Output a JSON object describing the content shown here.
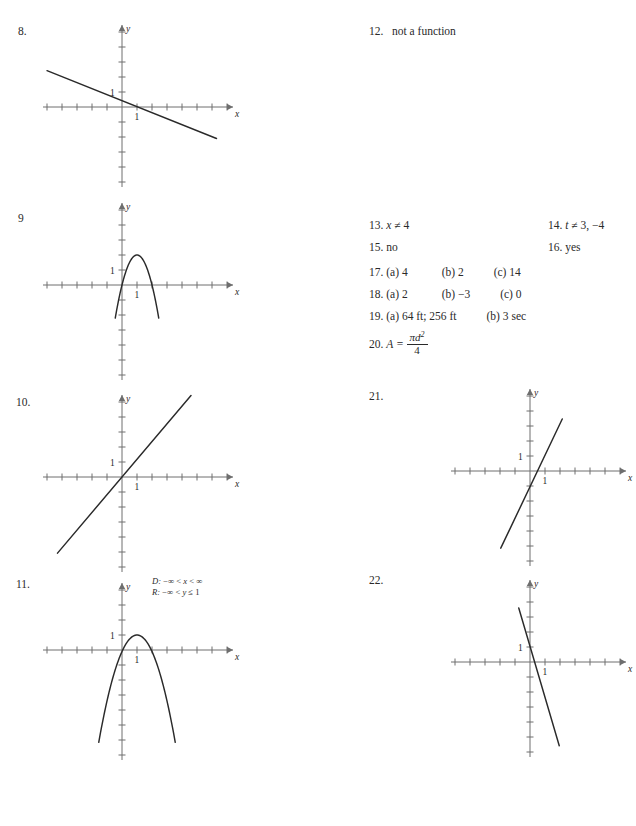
{
  "page": {
    "width": 636,
    "height": 826,
    "background": "#ffffff",
    "ink": "#2a2a2a",
    "axis_color": "#6e6e6e"
  },
  "left_column": {
    "items": [
      {
        "number": "8.",
        "num_x": 18,
        "num_y": 25,
        "graph": {
          "x": 40,
          "y": 14,
          "w": 190,
          "h": 170,
          "origin_x": 82,
          "origin_y": 93,
          "unit": 15,
          "x_ticks_left": 5,
          "x_ticks_right": 7,
          "y_ticks_up": 5,
          "y_ticks_down": 5,
          "x_label": "x",
          "y_label": "y",
          "one_x_label": "1",
          "one_y_label": "1",
          "type": "line",
          "slope": -0.4,
          "intercept": 0.42,
          "x_from": -5.0,
          "x_to": 6.3
        }
      },
      {
        "number": "9",
        "num_x": 18,
        "num_y": 212,
        "graph": {
          "x": 40,
          "y": 200,
          "w": 190,
          "h": 1.0,
          "origin_x": 82,
          "origin_y": 85,
          "unit": 15,
          "x_ticks_left": 5,
          "x_ticks_right": 7,
          "y_ticks_up": 5,
          "y_ticks_down": 6,
          "x_label": "x",
          "y_label": "y",
          "one_x_label": "1",
          "one_y_label": "1",
          "type": "parabola",
          "a": -2.0,
          "k": 2.0,
          "x_from": -0.45,
          "x_to": 2.45
        }
      },
      {
        "number": "10.",
        "num_x": 16,
        "num_y": 396,
        "graph": {
          "x": 40,
          "y": 386,
          "w": 190,
          "h": 180,
          "origin_x": 82,
          "origin_y": 91,
          "unit": 15,
          "x_ticks_left": 5,
          "x_ticks_right": 7,
          "y_ticks_up": 5,
          "y_ticks_down": 6,
          "x_label": "x",
          "y_label": "y",
          "one_x_label": "1",
          "one_y_label": "1",
          "type": "line",
          "slope": 1.18,
          "intercept": 0,
          "x_from": -4.3,
          "x_to": 4.6
        }
      },
      {
        "number": "11.",
        "num_x": 16,
        "num_y": 578,
        "graph": {
          "x": 40,
          "y": 582,
          "w": 190,
          "h": 1.0,
          "origin_x": 82,
          "origin_y": 68,
          "unit": 15,
          "x_ticks_left": 5,
          "x_ticks_right": 7,
          "y_ticks_up": 4,
          "y_ticks_down": 7,
          "x_label": "x",
          "y_label": "y",
          "one_x_label": "1",
          "one_y_label": "1",
          "type": "parabola",
          "a": -1.1,
          "k": 1.0,
          "x_from": -1.55,
          "x_to": 3.55
        },
        "annotation": {
          "x": 152,
          "y": 576,
          "line1_prefix": "D:",
          "line1_body": " −∞ < x < ∞",
          "line2_prefix": "R:",
          "line2_body": " −∞ < y ≤ 1"
        }
      }
    ]
  },
  "right_column": {
    "item12": {
      "number": "12.",
      "num_x": 369,
      "num_y": 25,
      "text": "not a function",
      "text_x": 392,
      "text_y": 25,
      "graph": {
        "x": 455,
        "y": 20,
        "w": 175,
        "h": -1.0,
        "origin_x": 52,
        "origin_y": 91,
        "unit": 15,
        "x_ticks_left": 3,
        "x_ticks_right": 7,
        "y_ticks_up": 5,
        "y_ticks_down": 5,
        "x_label": "x",
        "y_label": "y",
        "one_x_label": "1",
        "one_y_label": "1",
        "type": "sideways_parabola",
        "a": 1.0,
        "y_from": -3.05,
        "y_to": 3.05,
        "equation": "x = y² − 1",
        "equation_x": 95,
        "equation_y": 22
      }
    },
    "text_answers": [
      {
        "number": "13.",
        "x": 369,
        "y": 219,
        "parts": [
          {
            "text": "x",
            "italic": true
          },
          {
            "text": " ≠ 4",
            "italic": false
          }
        ]
      },
      {
        "number": "14.",
        "x": 548,
        "y": 219,
        "parts": [
          {
            "text": "t",
            "italic": true
          },
          {
            "text": " ≠ 3, −4",
            "italic": false
          }
        ]
      },
      {
        "number": "15.",
        "x": 369,
        "y": 241,
        "parts": [
          {
            "text": "no",
            "italic": false
          }
        ]
      },
      {
        "number": "16.",
        "x": 548,
        "y": 241,
        "parts": [
          {
            "text": "yes",
            "italic": false
          }
        ]
      },
      {
        "number": "17.",
        "x": 369,
        "y": 266,
        "parts": [
          {
            "text": "(a)  4",
            "italic": false
          },
          {
            "gap": "a"
          },
          {
            "text": "(b)  2",
            "italic": false
          },
          {
            "gap": "b"
          },
          {
            "text": "(c)  14",
            "italic": false
          }
        ]
      },
      {
        "number": "18.",
        "x": 369,
        "y": 288,
        "parts": [
          {
            "text": "(a)  2",
            "italic": false
          },
          {
            "gap": "a"
          },
          {
            "text": "(b)  −3",
            "italic": false
          },
          {
            "gap": "b"
          },
          {
            "text": "(c)  0",
            "italic": false
          }
        ]
      },
      {
        "number": "19.",
        "x": 369,
        "y": 310,
        "parts": [
          {
            "text": "(a)  64 ft; 256 ft",
            "italic": false
          },
          {
            "gap": "b"
          },
          {
            "text": "(b)  3 sec",
            "italic": false
          }
        ]
      }
    ],
    "formula20": {
      "number": "20.",
      "x": 369,
      "y": 331,
      "lhs": "A =",
      "numerator_pi": "π",
      "numerator_d": "d",
      "numerator_exp": "2",
      "denominator": "4"
    },
    "item21": {
      "number": "21.",
      "num_x": 369,
      "num_y": 390,
      "graph": {
        "x": 455,
        "y": 384,
        "w": 185,
        "h": 180,
        "origin_x": 75,
        "origin_y": 87,
        "unit": 15,
        "x_ticks_left": 5,
        "x_ticks_right": 6,
        "y_ticks_up": 5,
        "y_ticks_down": 6,
        "x_label": "x",
        "y_label": "y",
        "one_x_label": "1",
        "one_y_label": "1",
        "type": "line",
        "slope": 2.1,
        "intercept": -1.05,
        "x_from": -1.95,
        "x_to": 2.15
      }
    },
    "item22": {
      "number": "22.",
      "num_x": 369,
      "num_y": 574,
      "graph": {
        "x": 455,
        "y": 566,
        "w": 185,
        "h": 190,
        "origin_x": 75,
        "origin_y": 96,
        "unit": 15,
        "x_ticks_left": 5,
        "x_ticks_right": 6,
        "y_ticks_up": 5,
        "y_ticks_down": 6,
        "x_label": "x",
        "y_label": "y",
        "one_x_label": "1",
        "one_y_label": "1",
        "type": "line",
        "slope": -3.4,
        "intercept": 1.05,
        "x_from": -0.75,
        "x_to": 1.95
      }
    }
  }
}
